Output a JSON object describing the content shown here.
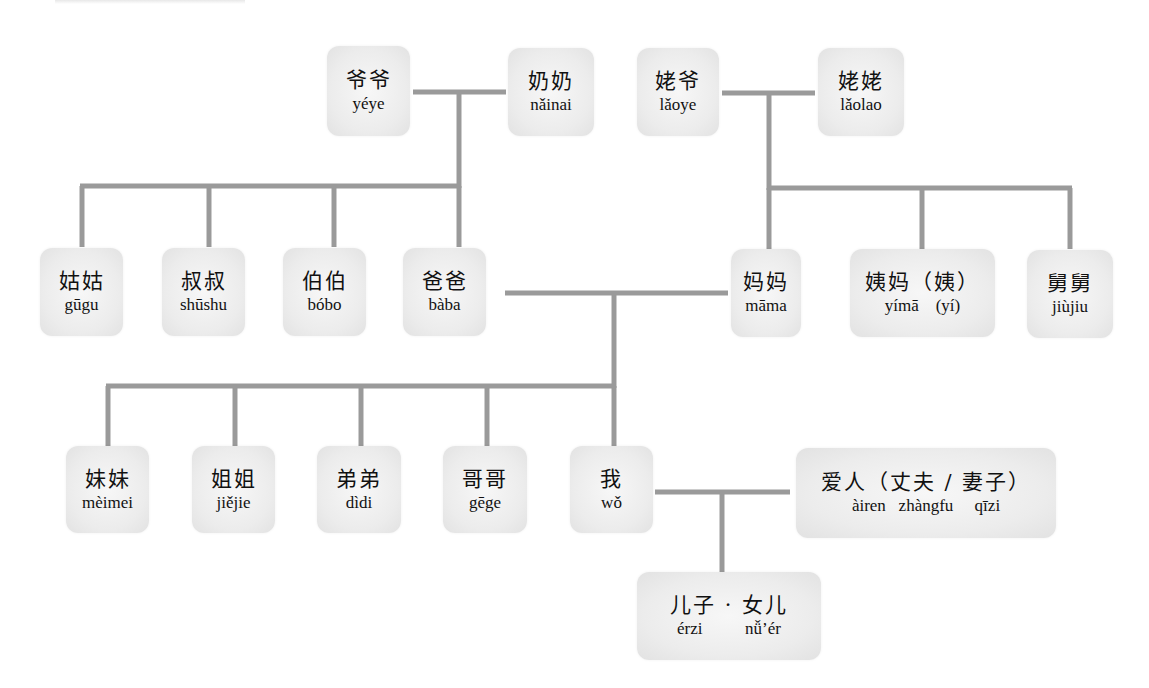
{
  "diagram": {
    "type": "family-tree",
    "line_color": "#9a9a9a",
    "box_color": "#ececec"
  },
  "nodes": {
    "yeye": {
      "hanzi": "爷爷",
      "pinyin": "yéye"
    },
    "nainai": {
      "hanzi": "奶奶",
      "pinyin": "nǎinai"
    },
    "laoye": {
      "hanzi": "姥爷",
      "pinyin": "lǎoye"
    },
    "laolao": {
      "hanzi": "姥姥",
      "pinyin": "lǎolao"
    },
    "gugu": {
      "hanzi": "姑姑",
      "pinyin": "gūgu"
    },
    "shushu": {
      "hanzi": "叔叔",
      "pinyin": "shūshu"
    },
    "bobo": {
      "hanzi": "伯伯",
      "pinyin": "bóbo"
    },
    "baba": {
      "hanzi": "爸爸",
      "pinyin": "bàba"
    },
    "mama": {
      "hanzi": "妈妈",
      "pinyin": "māma"
    },
    "yima": {
      "hanzi": "姨妈（姨）",
      "pinyin": "yímā    (yí)"
    },
    "jiujiu": {
      "hanzi": "舅舅",
      "pinyin": "jiùjiu"
    },
    "meimei": {
      "hanzi": "妹妹",
      "pinyin": "mèimei"
    },
    "jiejie": {
      "hanzi": "姐姐",
      "pinyin": "jiějie"
    },
    "didi": {
      "hanzi": "弟弟",
      "pinyin": "dìdi"
    },
    "gege": {
      "hanzi": "哥哥",
      "pinyin": "gēge"
    },
    "wo": {
      "hanzi": "我",
      "pinyin": "wǒ"
    },
    "airen": {
      "hanzi": "爱人（丈夫 / 妻子）",
      "pinyin": "àiren   zhàngfu     qīzi"
    },
    "children": {
      "hanzi": "儿子 · 女儿",
      "pinyin": "érzi          nǚ’ér"
    }
  }
}
